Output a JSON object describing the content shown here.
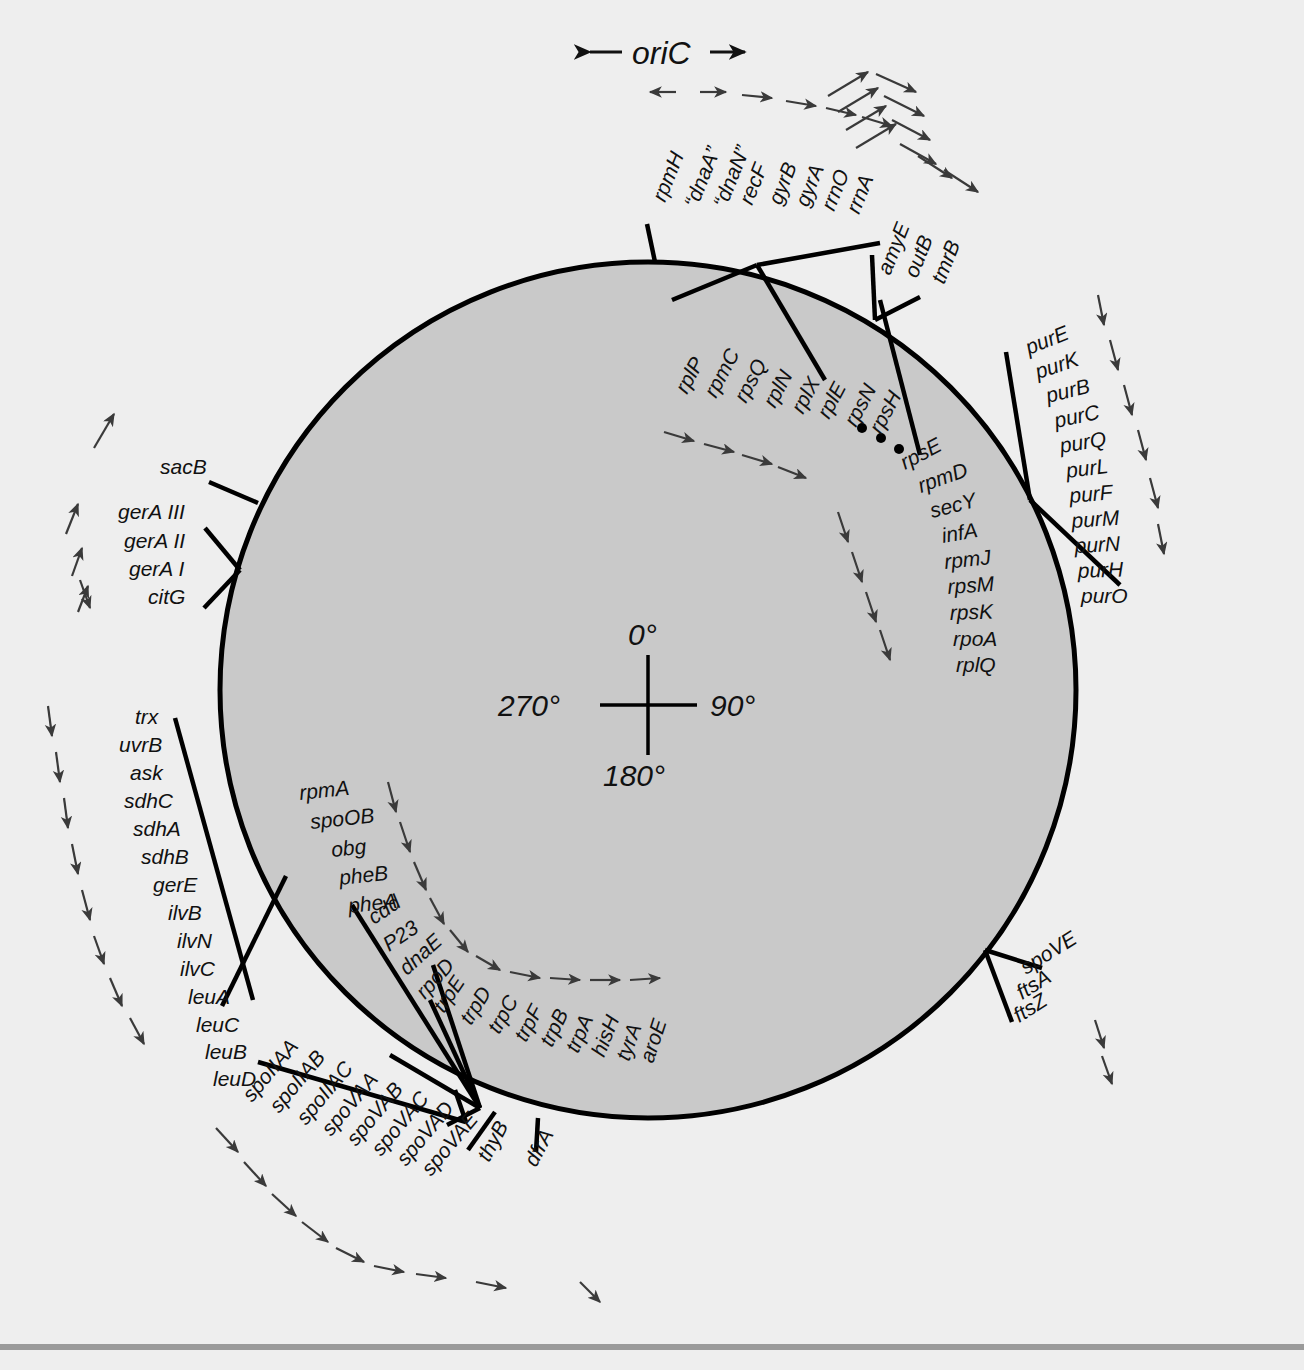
{
  "figure": {
    "type": "circular-genetic-map",
    "organism_map_title": "Bacillus subtilis chromosome genetic map",
    "origin_label": "oriC",
    "origin_left_arrow": "←",
    "origin_right_arrow": "→",
    "ellipsis_marker": "• • •"
  },
  "compass": {
    "top": "0°",
    "right": "90°",
    "bottom": "180°",
    "left": "270°"
  },
  "colors": {
    "background": "#eeeeee",
    "chromosome_fill": "#c9c9c9",
    "chromosome_stroke": "#000000",
    "label_text": "#111111",
    "direction_arrow": "#3a3a3a",
    "footer_rule": "#9a9a9a"
  },
  "clusters": [
    {
      "id": "oric-region",
      "position": "top-center",
      "genes": [
        "rpmH",
        "“dnaA”",
        "“dnaN”",
        "recF",
        "gyrB",
        "gyrA",
        "rrnO",
        "rrnA"
      ]
    },
    {
      "id": "amye-region",
      "position": "top-right",
      "genes": [
        "amyE",
        "outB",
        "tmrB"
      ]
    },
    {
      "id": "ribosomal-protein-operon",
      "position": "upper-right-inner",
      "genes": [
        "rplP",
        "rpmC",
        "rpsQ",
        "rplN",
        "rplX",
        "rplE",
        "rpsN",
        "rpsH"
      ]
    },
    {
      "id": "ribosomal-protein-operon-continued",
      "position": "right-inner",
      "genes": [
        "rpsE",
        "rpmD",
        "secY",
        "infA",
        "rpmJ",
        "rpsM",
        "rpsK",
        "rpoA",
        "rplQ"
      ]
    },
    {
      "id": "purine-operon",
      "position": "right",
      "genes": [
        "purE",
        "purK",
        "purB",
        "purC",
        "purQ",
        "purL",
        "purF",
        "purM",
        "purN",
        "purH",
        "purO"
      ]
    },
    {
      "id": "sacb-region",
      "position": "upper-left",
      "genes": [
        "sacB"
      ]
    },
    {
      "id": "gera-region",
      "position": "upper-left",
      "genes": [
        "gerA III",
        "gerA II",
        "gerA I",
        "citG"
      ]
    },
    {
      "id": "leu-ilv-region",
      "position": "left",
      "genes": [
        "trx",
        "uvrB",
        "ask",
        "sdhC",
        "sdhA",
        "sdhB",
        "gerE",
        "ilvB",
        "ilvN",
        "ilvC",
        "leuA",
        "leuC",
        "leuB",
        "leuD"
      ]
    },
    {
      "id": "phe-region",
      "position": "lower-left-inner",
      "genes": [
        "rpmA",
        "spoOB",
        "obg",
        "pheB",
        "pheA"
      ]
    },
    {
      "id": "dnae-region",
      "position": "bottom-left-inner",
      "genes": [
        "cdd",
        "P23",
        "dnaE",
        "rpoD"
      ]
    },
    {
      "id": "trp-operon",
      "position": "bottom-inner",
      "genes": [
        "trpE",
        "trpD",
        "trpC",
        "trpF",
        "trpB",
        "trpA",
        "hisH",
        "tyrA",
        "aroE"
      ]
    },
    {
      "id": "spo-region",
      "position": "bottom-left",
      "genes": [
        "spoIIAA",
        "spoIIAB",
        "spoIIAC",
        "spoVAA",
        "spoVAB",
        "spoVAC",
        "spoVAD",
        "spoVAE"
      ]
    },
    {
      "id": "thy-region",
      "position": "bottom-center",
      "genes": [
        "thyB",
        "dfrA"
      ]
    },
    {
      "id": "fts-region",
      "position": "lower-right",
      "genes": [
        "spoVE",
        "ftsA",
        "ftsZ"
      ]
    }
  ],
  "labels": {
    "oric_cluster": [
      {
        "text": "rpmH",
        "x": 665,
        "y": 203,
        "rot": -68
      },
      {
        "text": "“dnaA”",
        "x": 697,
        "y": 209,
        "rot": -68
      },
      {
        "text": "“dnaN”",
        "x": 726,
        "y": 209,
        "rot": -68
      },
      {
        "text": "recF",
        "x": 752,
        "y": 206,
        "rot": -68
      },
      {
        "text": "gyrB",
        "x": 781,
        "y": 206,
        "rot": -68
      },
      {
        "text": "gyrA",
        "x": 808,
        "y": 208,
        "rot": -68
      },
      {
        "text": "rrnO",
        "x": 834,
        "y": 212,
        "rot": -68
      },
      {
        "text": "rrnA",
        "x": 859,
        "y": 215,
        "rot": -68
      }
    ],
    "amye_cluster": [
      {
        "text": "amyE",
        "x": 890,
        "y": 276,
        "rot": -68
      },
      {
        "text": "outB",
        "x": 917,
        "y": 279,
        "rot": -68
      },
      {
        "text": "tmrB",
        "x": 944,
        "y": 285,
        "rot": -68
      }
    ],
    "ribo_cluster_a": [
      {
        "text": "rplP",
        "x": 687,
        "y": 395,
        "rot": -62
      },
      {
        "text": "rpmC",
        "x": 716,
        "y": 399,
        "rot": -62
      },
      {
        "text": "rpsQ",
        "x": 746,
        "y": 404,
        "rot": -62
      },
      {
        "text": "rplN",
        "x": 775,
        "y": 409,
        "rot": -62
      },
      {
        "text": "rplX",
        "x": 803,
        "y": 415,
        "rot": -62
      },
      {
        "text": "rplE",
        "x": 829,
        "y": 420,
        "rot": -62
      },
      {
        "text": "rpsN",
        "x": 856,
        "y": 428,
        "rot": -62
      },
      {
        "text": "rpsH",
        "x": 881,
        "y": 435,
        "rot": -62
      }
    ],
    "ribo_cluster_b": [
      {
        "text": "rpsE",
        "x": 905,
        "y": 470,
        "rot": -28
      },
      {
        "text": "rpmD",
        "x": 921,
        "y": 493,
        "rot": -20
      },
      {
        "text": "secY",
        "x": 932,
        "y": 518,
        "rot": -14
      },
      {
        "text": "infA",
        "x": 943,
        "y": 543,
        "rot": -10
      },
      {
        "text": "rpmJ",
        "x": 945,
        "y": 569,
        "rot": -6
      },
      {
        "text": "rpsM",
        "x": 948,
        "y": 594,
        "rot": -4
      },
      {
        "text": "rpsK",
        "x": 950,
        "y": 620,
        "rot": -2
      },
      {
        "text": "rpoA",
        "x": 953,
        "y": 646,
        "rot": 0
      },
      {
        "text": "rplQ",
        "x": 956,
        "y": 672,
        "rot": 0
      }
    ],
    "pur_cluster": [
      {
        "text": "purE",
        "x": 1029,
        "y": 355,
        "rot": -22
      },
      {
        "text": "purK",
        "x": 1038,
        "y": 379,
        "rot": -18
      },
      {
        "text": "purB",
        "x": 1048,
        "y": 403,
        "rot": -14
      },
      {
        "text": "purC",
        "x": 1056,
        "y": 428,
        "rot": -12
      },
      {
        "text": "purQ",
        "x": 1061,
        "y": 453,
        "rot": -9
      },
      {
        "text": "purL",
        "x": 1067,
        "y": 478,
        "rot": -7
      },
      {
        "text": "purF",
        "x": 1070,
        "y": 503,
        "rot": -5
      },
      {
        "text": "purM",
        "x": 1072,
        "y": 528,
        "rot": -4
      },
      {
        "text": "purN",
        "x": 1075,
        "y": 553,
        "rot": -3
      },
      {
        "text": "purH",
        "x": 1078,
        "y": 578,
        "rot": -2
      },
      {
        "text": "purO",
        "x": 1081,
        "y": 603,
        "rot": 0
      }
    ],
    "sacb_cluster": [
      {
        "text": "sacB",
        "x": 160,
        "y": 474,
        "rot": 0
      }
    ],
    "gera_cluster": [
      {
        "text": "gerA III",
        "x": 118,
        "y": 519,
        "rot": 0
      },
      {
        "text": "gerA II",
        "x": 124,
        "y": 548,
        "rot": 0
      },
      {
        "text": "gerA I",
        "x": 129,
        "y": 576,
        "rot": 0
      },
      {
        "text": "citG",
        "x": 148,
        "y": 604,
        "rot": 0
      }
    ],
    "leu_cluster": [
      {
        "text": "trx",
        "x": 135,
        "y": 724,
        "rot": 0
      },
      {
        "text": "uvrB",
        "x": 119,
        "y": 752,
        "rot": 0
      },
      {
        "text": "ask",
        "x": 130,
        "y": 780,
        "rot": 0
      },
      {
        "text": "sdhC",
        "x": 124,
        "y": 808,
        "rot": 0
      },
      {
        "text": "sdhA",
        "x": 133,
        "y": 836,
        "rot": 0
      },
      {
        "text": "sdhB",
        "x": 141,
        "y": 864,
        "rot": 0
      },
      {
        "text": "gerE",
        "x": 153,
        "y": 892,
        "rot": 0
      },
      {
        "text": "ilvB",
        "x": 168,
        "y": 920,
        "rot": 0
      },
      {
        "text": "ilvN",
        "x": 177,
        "y": 948,
        "rot": 0
      },
      {
        "text": "ilvC",
        "x": 180,
        "y": 976,
        "rot": 0
      },
      {
        "text": "leuA",
        "x": 188,
        "y": 1004,
        "rot": 0
      },
      {
        "text": "leuC",
        "x": 196,
        "y": 1032,
        "rot": 0
      },
      {
        "text": "leuB",
        "x": 205,
        "y": 1059,
        "rot": 0
      },
      {
        "text": "leuD",
        "x": 213,
        "y": 1086,
        "rot": 0
      }
    ],
    "phe_cluster": [
      {
        "text": "rpmA",
        "x": 300,
        "y": 800,
        "rot": -6
      },
      {
        "text": "spoOB",
        "x": 311,
        "y": 829,
        "rot": -6
      },
      {
        "text": "obg",
        "x": 332,
        "y": 857,
        "rot": -6
      },
      {
        "text": "pheB",
        "x": 340,
        "y": 885,
        "rot": -6
      },
      {
        "text": "pheA",
        "x": 349,
        "y": 913,
        "rot": -6
      }
    ],
    "dnae_cluster": [
      {
        "text": "cdd",
        "x": 374,
        "y": 925,
        "rot": -34
      },
      {
        "text": "P23",
        "x": 389,
        "y": 952,
        "rot": -34
      },
      {
        "text": "dnaE",
        "x": 407,
        "y": 976,
        "rot": -42
      },
      {
        "text": "rpoD",
        "x": 425,
        "y": 1000,
        "rot": -48
      }
    ],
    "trp_cluster": [
      {
        "text": "trpE",
        "x": 444,
        "y": 1014,
        "rot": -56
      },
      {
        "text": "trpD",
        "x": 471,
        "y": 1026,
        "rot": -58
      },
      {
        "text": "trpC",
        "x": 499,
        "y": 1035,
        "rot": -60
      },
      {
        "text": "trpF",
        "x": 526,
        "y": 1043,
        "rot": -62
      },
      {
        "text": "trpB",
        "x": 552,
        "y": 1048,
        "rot": -64
      },
      {
        "text": "trpA",
        "x": 578,
        "y": 1054,
        "rot": -66
      },
      {
        "text": "hisH",
        "x": 604,
        "y": 1058,
        "rot": -68
      },
      {
        "text": "tyrA",
        "x": 629,
        "y": 1062,
        "rot": -70
      },
      {
        "text": "aroE",
        "x": 653,
        "y": 1064,
        "rot": -72
      }
    ],
    "spo_cluster": [
      {
        "text": "spoIIAA",
        "x": 252,
        "y": 1103,
        "rot": -50
      },
      {
        "text": "spoIIAB",
        "x": 279,
        "y": 1114,
        "rot": -50
      },
      {
        "text": "spoIIAC",
        "x": 306,
        "y": 1126,
        "rot": -50
      },
      {
        "text": "spoVAA",
        "x": 331,
        "y": 1137,
        "rot": -50
      },
      {
        "text": "spoVAB",
        "x": 356,
        "y": 1147,
        "rot": -50
      },
      {
        "text": "spoVAC",
        "x": 381,
        "y": 1157,
        "rot": -50
      },
      {
        "text": "spoVAD",
        "x": 406,
        "y": 1167,
        "rot": -50
      },
      {
        "text": "spoVAE",
        "x": 431,
        "y": 1177,
        "rot": -50
      }
    ],
    "thy_cluster": [
      {
        "text": "thyB",
        "x": 489,
        "y": 1163,
        "rot": -62
      },
      {
        "text": "dfrA",
        "x": 536,
        "y": 1168,
        "rot": -62
      }
    ],
    "fts_cluster": [
      {
        "text": "spoVE",
        "x": 1026,
        "y": 975,
        "rot": -32
      },
      {
        "text": "ftsA",
        "x": 1022,
        "y": 1000,
        "rot": -32
      },
      {
        "text": "ftsZ",
        "x": 1019,
        "y": 1023,
        "rot": -32
      }
    ]
  }
}
